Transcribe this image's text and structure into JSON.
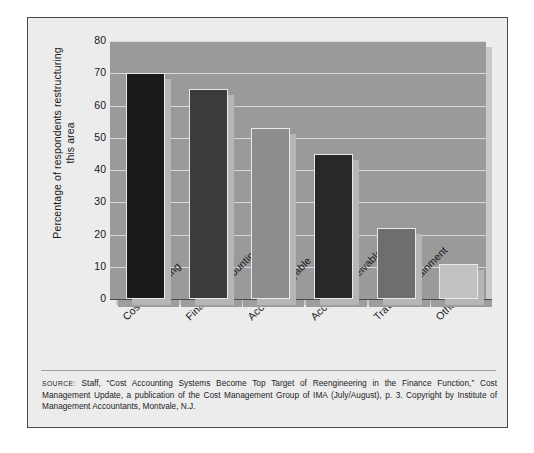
{
  "figure": {
    "y_axis_title": "Percentage of respondents restructuring this area",
    "source_label": "Source:",
    "source_text": " Staff, “Cost Accounting Systems Become Top Target of Reengineering in the Finance Function,” Cost Management Update, a publication of the Cost Management Group of IMA (July/August), p. 3. Copyright by Institute of Management Accountants, Montvale, N.J."
  },
  "chart_data": {
    "type": "bar",
    "title": "",
    "xlabel": "",
    "ylabel": "Percentage of respondents restructuring this area",
    "ylim": [
      0,
      80
    ],
    "yticks": [
      0,
      10,
      20,
      30,
      40,
      50,
      60,
      70,
      80
    ],
    "ytick_labels": [
      "0",
      "10",
      "20",
      "30",
      "40",
      "50",
      "60",
      "70",
      "80"
    ],
    "grid": true,
    "legend": "none",
    "categories": [
      "Cost accounting",
      "Financial accounting",
      "Accounts payable",
      "Accounts receivable",
      "Travel/Entertainment",
      "Other"
    ],
    "values": [
      70,
      65,
      53,
      45,
      22,
      11
    ],
    "bar_colors": [
      "#1a1a1c",
      "#3b3b3e",
      "#8d8d8f",
      "#28282b",
      "#6e6e71",
      "#c2c2c4"
    ],
    "plot_background": "#9a9a9a",
    "gridline_color": "#d9d9d9",
    "frame_color": "#4a4a4a"
  }
}
